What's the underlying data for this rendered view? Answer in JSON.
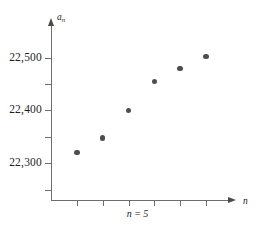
{
  "chart_data": {
    "type": "scatter",
    "title": "",
    "subtitle": "",
    "caption": "n = 5",
    "xlabel": "n",
    "ylabel": "a_n",
    "ylabel_base": "a",
    "ylabel_sub": "n",
    "x": [
      1,
      2,
      3,
      4,
      5,
      6
    ],
    "values": [
      22320,
      22348,
      22400,
      22455,
      22480,
      22502
    ],
    "point_labels": [
      "22,320",
      "22,348",
      "22,400",
      "22,455",
      "22,480",
      "22,502"
    ],
    "ytick_labels": [
      "22,500",
      "22,400",
      "22,300"
    ],
    "ytick_values": [
      22500,
      22400,
      22300
    ],
    "yminor_tick_values": [
      22250,
      22350,
      22450
    ],
    "xtick_values": [
      1,
      2,
      3,
      4,
      5,
      6
    ],
    "xtick_labels": [
      "",
      "",
      "",
      "",
      "",
      ""
    ],
    "xlim": [
      0,
      6.7
    ],
    "ylim": [
      22230,
      22560
    ],
    "grid": false,
    "legend": null,
    "point_color": "#4d4d4d",
    "axis_color": "#6d6e71",
    "text_color": "#231f20"
  }
}
